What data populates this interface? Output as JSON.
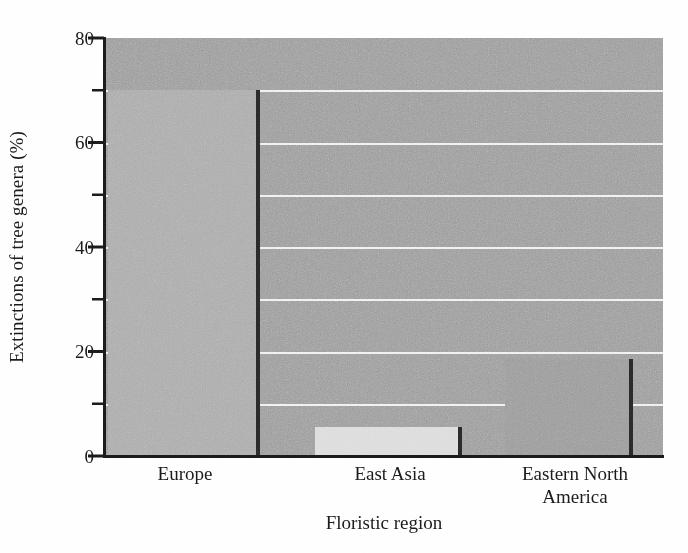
{
  "chart_data": {
    "type": "bar",
    "title": "",
    "xlabel": "Floristic region",
    "ylabel": "Extinctions of tree genera (%)",
    "categories": [
      "Europe",
      "East Asia",
      "Eastern North America"
    ],
    "values": [
      70,
      5.5,
      18.5
    ],
    "ylim": [
      0,
      80
    ],
    "ymajor_ticks": [
      0,
      20,
      40,
      60,
      80
    ],
    "yminor_ticks": [
      10,
      30,
      50,
      70
    ],
    "ytick_labels": [
      "0",
      "20",
      "40",
      "60",
      "80"
    ],
    "grid": true,
    "gridlines_at": [
      10,
      20,
      30,
      40,
      50,
      60,
      70
    ],
    "legend": "none",
    "series": [
      {
        "name": "Extinctions of tree genera",
        "values": [
          70,
          5.5,
          18.5
        ]
      }
    ],
    "bar_colors": [
      "#ababab",
      "#dcdcdc",
      "#9a9a9a"
    ],
    "plot_background": "#9a9a9a",
    "gridline_color": "#f2f2f2",
    "bar_edge_color": "#2a2a2a",
    "axis_color": "#1a1a1a"
  },
  "axis": {
    "y_title": "Extinctions of tree genera (%)",
    "x_title": "Floristic region",
    "y_labels": [
      {
        "value": 80,
        "text": "80"
      },
      {
        "value": 60,
        "text": "60"
      },
      {
        "value": 40,
        "text": "40"
      },
      {
        "value": 20,
        "text": "20"
      },
      {
        "value": 0,
        "text": "0"
      }
    ],
    "x_labels": [
      {
        "line1": "Europe",
        "line2": ""
      },
      {
        "line1": "East Asia",
        "line2": ""
      },
      {
        "line1": "Eastern North",
        "line2": "America"
      }
    ]
  }
}
